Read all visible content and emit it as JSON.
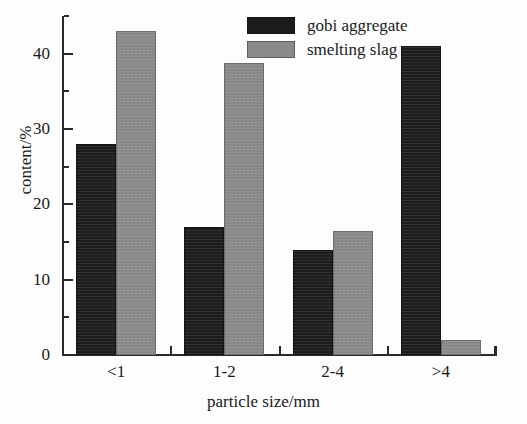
{
  "chart_data": {
    "type": "bar",
    "title": "",
    "subtitle": "",
    "xlabel": "particle size/mm",
    "ylabel": "content/%",
    "categories": [
      "<1",
      "1-2",
      "2-4",
      ">4"
    ],
    "series": [
      {
        "name": "gobi aggregate",
        "color": "#1c1c1c",
        "values": [
          28,
          17,
          14,
          41
        ]
      },
      {
        "name": "smelting slag",
        "color": "#8a8a8a",
        "values": [
          43,
          38.8,
          16.4,
          2
        ]
      }
    ],
    "ylim": [
      0,
      45
    ],
    "xlim_note": "categorical, 4 groups",
    "yticks_major": [
      0,
      10,
      20,
      30,
      40
    ],
    "yticks_minor": [
      5,
      15,
      25,
      35,
      45
    ],
    "ytick_labels": [
      "0",
      "10",
      "20",
      "30",
      "40"
    ],
    "grid": false,
    "legend_position": "top-right",
    "legend_entries": [
      "gobi aggregate",
      "smelting slag"
    ],
    "annotations": [],
    "axis_style": {
      "spines": [
        "left",
        "bottom"
      ],
      "tick_direction": "in",
      "axis_color": "#2a2a2a"
    }
  },
  "legend": {
    "items": [
      {
        "label": "gobi aggregate",
        "swatch": "dark"
      },
      {
        "label": "smelting slag",
        "swatch": "gray"
      }
    ]
  },
  "axes": {
    "y_title": "content/%",
    "x_title": "particle size/mm",
    "y_tick_labels": [
      "0",
      "10",
      "20",
      "30",
      "40"
    ],
    "x_tick_labels": [
      "<1",
      "1-2",
      "2-4",
      ">4"
    ]
  }
}
